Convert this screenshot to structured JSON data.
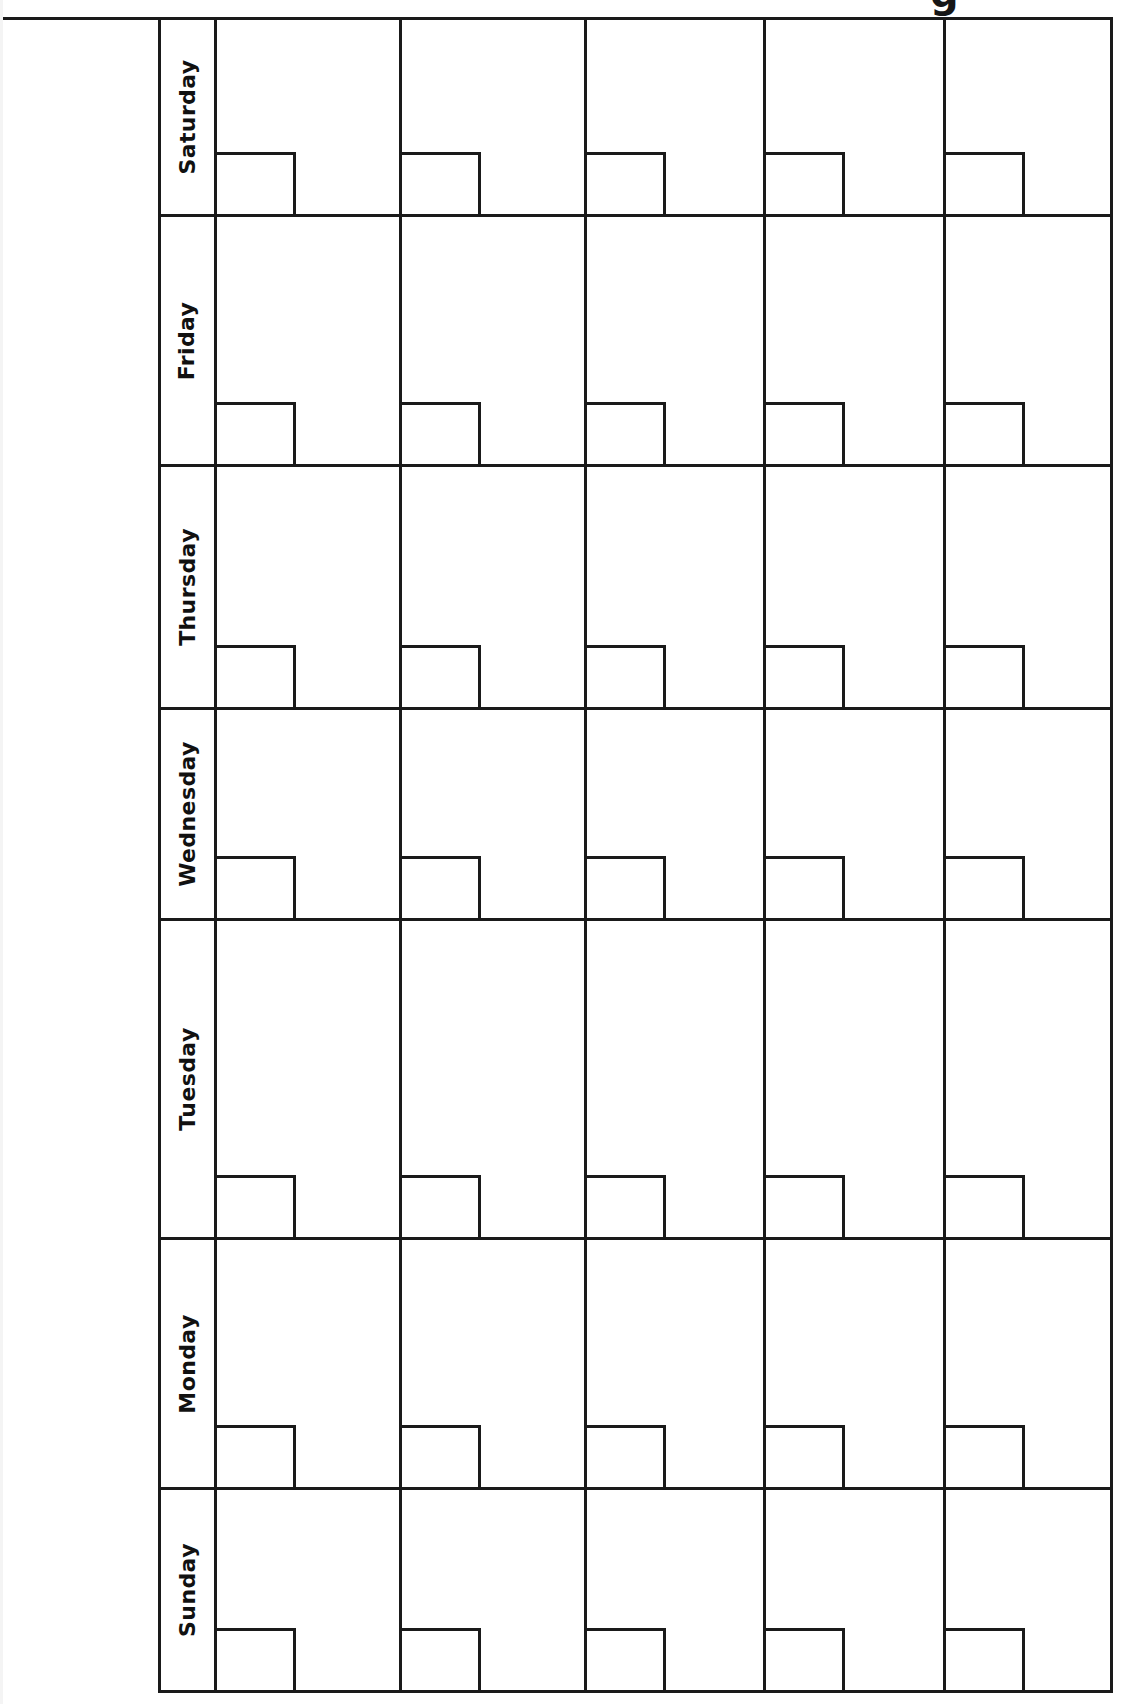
{
  "document": {
    "kind": "blank-monthly-calendar-template",
    "orientation": "rotated-landscape",
    "title_partial": "g",
    "accent_color": "#1a1a1a",
    "paper_color": "#ffffff"
  },
  "calendar": {
    "day_header_label": "",
    "days": [
      {
        "name": "Saturday"
      },
      {
        "name": "Friday"
      },
      {
        "name": "Thursday"
      },
      {
        "name": "Wednesday"
      },
      {
        "name": "Tuesday"
      },
      {
        "name": "Monday"
      },
      {
        "name": "Sunday"
      }
    ],
    "week_count": 5,
    "weeks": [
      {
        "label": "Week 1"
      },
      {
        "label": "Week 2"
      },
      {
        "label": "Week 3"
      },
      {
        "label": "Week 4"
      },
      {
        "label": "Week 5"
      }
    ],
    "cells": {
      "saturday": [
        "",
        "",
        "",
        "",
        ""
      ],
      "friday": [
        "",
        "",
        "",
        "",
        ""
      ],
      "thursday": [
        "",
        "",
        "",
        "",
        ""
      ],
      "wednesday": [
        "",
        "",
        "",
        "",
        ""
      ],
      "tuesday": [
        "",
        "",
        "",
        "",
        ""
      ],
      "monday": [
        "",
        "",
        "",
        "",
        ""
      ],
      "sunday": [
        "",
        "",
        "",
        "",
        ""
      ]
    }
  },
  "layout": {
    "grid_left": 158,
    "grid_top": 17,
    "grid_right": 1113,
    "grid_bottom": 1693,
    "dayname_col_width": 56,
    "row_boundaries": [
      17,
      214,
      464,
      707,
      918,
      1237,
      1487,
      1693
    ],
    "column_boundaries": [
      216,
      405,
      590,
      770,
      950,
      1113
    ],
    "date_box_width": 79,
    "date_box_height": 62
  }
}
